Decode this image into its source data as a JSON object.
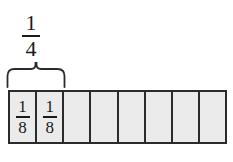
{
  "diagram": {
    "type": "fraction-bar",
    "background_color": "#ffffff",
    "cell_fill_color": "#ebebeb",
    "line_color": "#2b2b2b",
    "text_color": "#1a1a1a",
    "group_label": {
      "numerator": "1",
      "denominator": "4",
      "spans_cells": 2,
      "brace_icon": "curly-brace-up-icon"
    },
    "bar": {
      "total_cells": 8,
      "cells": [
        {
          "numerator": "1",
          "denominator": "8",
          "labeled": true
        },
        {
          "numerator": "1",
          "denominator": "8",
          "labeled": true
        },
        {
          "numerator": "",
          "denominator": "",
          "labeled": false
        },
        {
          "numerator": "",
          "denominator": "",
          "labeled": false
        },
        {
          "numerator": "",
          "denominator": "",
          "labeled": false
        },
        {
          "numerator": "",
          "denominator": "",
          "labeled": false
        },
        {
          "numerator": "",
          "denominator": "",
          "labeled": false
        },
        {
          "numerator": "",
          "denominator": "",
          "labeled": false
        }
      ]
    }
  }
}
